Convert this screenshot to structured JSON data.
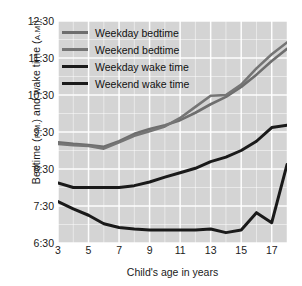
{
  "chart_data": {
    "type": "line",
    "title": "",
    "xlabel": "Child's age in years",
    "ylabel": "Bedtime (P.M.) and wake time (A.M.)",
    "ylabel_parts": {
      "main1": "Bedtime (",
      "sc1": "P.M.",
      "main2": ") and wake time (",
      "sc2": "A.M.",
      "main3": ")"
    },
    "x": [
      3,
      4,
      5,
      6,
      7,
      8,
      9,
      10,
      11,
      12,
      13,
      14,
      15,
      16,
      17,
      18
    ],
    "xlim": [
      3,
      18
    ],
    "ylim": [
      6.5,
      12.5
    ],
    "ytick_labels": [
      "12:30",
      "11:30",
      "10:30",
      "9:30",
      "8:30",
      "7:30",
      "6:30"
    ],
    "ytick_values": [
      12.5,
      11.5,
      10.5,
      9.5,
      8.5,
      7.5,
      6.5
    ],
    "xtick_labels": [
      "3",
      "5",
      "7",
      "9",
      "11",
      "13",
      "15",
      "17"
    ],
    "xtick_values": [
      3,
      5,
      7,
      9,
      11,
      13,
      15,
      17
    ],
    "grid": true,
    "grid_minor": true,
    "grid_color": "#ffffff",
    "plot_background": "#d4d4d4",
    "legend_position": "upper left",
    "series": [
      {
        "name": "Weekday bedtime",
        "color": "#6e6e6e",
        "width": 2.6,
        "values": [
          9.22,
          9.18,
          9.15,
          9.1,
          9.25,
          9.45,
          9.58,
          9.68,
          9.82,
          10.02,
          10.25,
          10.45,
          10.72,
          11.05,
          11.42,
          11.75
        ]
      },
      {
        "name": "Weekend bedtime",
        "color": "#757575",
        "width": 2.6,
        "values": [
          9.18,
          9.14,
          9.12,
          9.05,
          9.22,
          9.4,
          9.52,
          9.65,
          9.88,
          10.18,
          10.48,
          10.5,
          10.78,
          11.22,
          11.6,
          11.92
        ]
      },
      {
        "name": "Weekday wake time",
        "color": "#1a1a1a",
        "width": 3.0,
        "values": [
          8.12,
          8.0,
          8.0,
          8.0,
          8.0,
          8.05,
          8.15,
          8.28,
          8.4,
          8.52,
          8.7,
          8.82,
          9.0,
          9.25,
          9.62,
          9.68
        ]
      },
      {
        "name": "Weekend wake time",
        "color": "#1a1a1a",
        "width": 3.0,
        "values": [
          7.62,
          7.42,
          7.25,
          7.02,
          6.92,
          6.88,
          6.85,
          6.85,
          6.85,
          6.85,
          6.88,
          6.78,
          6.85,
          7.32,
          7.05,
          8.62
        ]
      }
    ]
  },
  "legend": {
    "items": [
      {
        "label": "Weekday bedtime",
        "color": "#6e6e6e",
        "thick": false
      },
      {
        "label": "Weekend bedtime",
        "color": "#757575",
        "thick": false
      },
      {
        "label": "Weekday wake time",
        "color": "#1a1a1a",
        "thick": true
      },
      {
        "label": "Weekend wake time",
        "color": "#1a1a1a",
        "thick": true
      }
    ]
  }
}
